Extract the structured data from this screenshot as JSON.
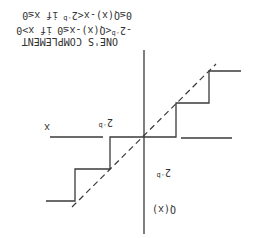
{
  "figure": {
    "orientation": "rotated 180 degrees",
    "title": "ONE'S COMPLEMENT",
    "condition_1": {
      "lower": "-2",
      "lower_exp": "-b",
      "expr": "<Q(x)-x≤0",
      "cond": "if x>0"
    },
    "condition_2": {
      "expr": "0≤Q(x)-x<2",
      "exp": "-b",
      "cond": "if x≤0"
    },
    "x_axis_label": "x",
    "y_axis_label": "Q(x)",
    "step_label_x": "2",
    "step_label_x_exp": "-b",
    "step_label_y": "2",
    "step_label_y_exp": "-b",
    "colors": {
      "ink": "#3a3a3a",
      "background": "#ffffff"
    }
  }
}
